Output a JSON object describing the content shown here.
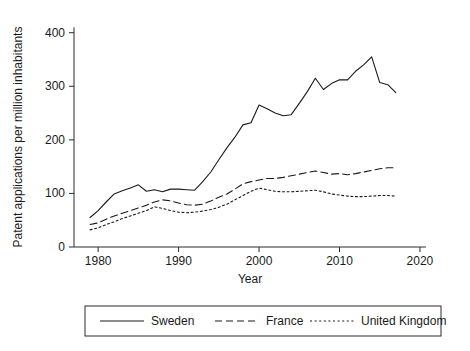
{
  "chart_data": {
    "type": "line",
    "title": "",
    "xlabel": "Year",
    "ylabel": "Patent applications per million inhabitants",
    "xlim": [
      1977,
      2021
    ],
    "ylim": [
      0,
      420
    ],
    "xticks": [
      1980,
      1990,
      2000,
      2010,
      2020
    ],
    "xticklabels": [
      "1980",
      "1990",
      "2000",
      "2010",
      "2020"
    ],
    "yticks": [
      0,
      100,
      200,
      300,
      400
    ],
    "yticklabels": [
      "0",
      "100",
      "200",
      "300",
      "400"
    ],
    "grid": false,
    "legend_position": "below-outside",
    "x": [
      1979,
      1980,
      1981,
      1982,
      1983,
      1984,
      1985,
      1986,
      1987,
      1988,
      1989,
      1990,
      1991,
      1992,
      1993,
      1994,
      1995,
      1996,
      1997,
      1998,
      1999,
      2000,
      2001,
      2002,
      2003,
      2004,
      2005,
      2006,
      2007,
      2008,
      2009,
      2010,
      2011,
      2012,
      2013,
      2014,
      2015,
      2016,
      2017
    ],
    "series": [
      {
        "name": "Sweden",
        "line_style": "solid",
        "color": "#1a1a1a",
        "values": [
          55,
          68,
          84,
          99,
          105,
          110,
          116,
          104,
          107,
          103,
          108,
          108,
          107,
          106,
          122,
          140,
          163,
          185,
          205,
          228,
          232,
          265,
          258,
          250,
          245,
          247,
          268,
          290,
          315,
          294,
          305,
          312,
          312,
          328,
          340,
          355,
          307,
          303,
          288
        ]
      },
      {
        "name": "France",
        "line_style": "dashed",
        "color": "#1a1a1a",
        "values": [
          42,
          45,
          52,
          58,
          63,
          68,
          73,
          78,
          84,
          88,
          86,
          82,
          79,
          78,
          80,
          86,
          93,
          99,
          108,
          118,
          122,
          125,
          128,
          128,
          130,
          133,
          136,
          139,
          142,
          139,
          136,
          137,
          135,
          137,
          140,
          143,
          146,
          148,
          148
        ]
      },
      {
        "name": "United Kingdom",
        "line_style": "dotted",
        "color": "#1a1a1a",
        "values": [
          32,
          36,
          42,
          47,
          53,
          58,
          63,
          68,
          75,
          72,
          68,
          65,
          64,
          65,
          67,
          70,
          74,
          80,
          88,
          96,
          104,
          110,
          107,
          104,
          103,
          103,
          104,
          105,
          106,
          103,
          99,
          97,
          95,
          94,
          94,
          95,
          96,
          96,
          95
        ]
      }
    ]
  },
  "legend": {
    "entries": [
      {
        "label": "Sweden",
        "style": "solid"
      },
      {
        "label": "France",
        "style": "dashed"
      },
      {
        "label": "United Kingdom",
        "style": "dotted"
      }
    ]
  }
}
